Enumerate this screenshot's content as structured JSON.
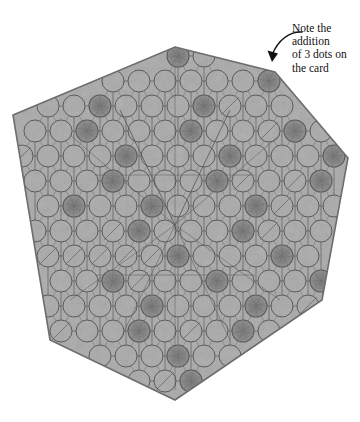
{
  "figure": {
    "kind": "hexagonal-game-board-photo",
    "shape": "hexagon",
    "background_color": "#ffffff",
    "board_fill": "#a9a9a9",
    "board_edge_color": "#6d6d6d",
    "circle_stroke": "#4a4a4a",
    "dark_dot_fill": "#7a7a7a",
    "line_color": "#5a5a5a"
  },
  "annotation": {
    "arrow_color": "#111111",
    "lines": [
      "Note the",
      "addition",
      "of 3 dots on",
      "the card"
    ],
    "full_text": "Note the addition of 3 dots on the card"
  },
  "board": {
    "hexagon_points": "175,47 275,72 348,158 322,300 175,400 50,340 13,115",
    "grid": {
      "type": "triangular-lattice",
      "columns": 13,
      "rows": 14,
      "spacing_x": 26,
      "spacing_y": 25,
      "circle_radius": 11,
      "origin_x": 22,
      "origin_y": 56
    },
    "dark_dots": [
      [
        6,
        0
      ],
      [
        9,
        1
      ],
      [
        12,
        1
      ],
      [
        3,
        2
      ],
      [
        7,
        2
      ],
      [
        11,
        2
      ],
      [
        2,
        3
      ],
      [
        6,
        3
      ],
      [
        10,
        3
      ],
      [
        4,
        4
      ],
      [
        8,
        4
      ],
      [
        12,
        4
      ],
      [
        3,
        5
      ],
      [
        7,
        5
      ],
      [
        11,
        5
      ],
      [
        2,
        6
      ],
      [
        5,
        6
      ],
      [
        9,
        6
      ],
      [
        4,
        7
      ],
      [
        8,
        7
      ],
      [
        6,
        8
      ],
      [
        10,
        8
      ],
      [
        3,
        9
      ],
      [
        7,
        9
      ],
      [
        11,
        9
      ],
      [
        5,
        10
      ],
      [
        9,
        10
      ],
      [
        4,
        11
      ],
      [
        8,
        11
      ],
      [
        6,
        12
      ],
      [
        6,
        13
      ]
    ],
    "web_lines": [
      [
        70,
        135,
        175,
        225
      ],
      [
        175,
        225,
        280,
        135
      ],
      [
        175,
        225,
        70,
        300
      ],
      [
        175,
        225,
        280,
        300
      ],
      [
        120,
        110,
        175,
        225
      ],
      [
        230,
        110,
        175,
        225
      ],
      [
        175,
        225,
        175,
        60
      ],
      [
        175,
        225,
        175,
        390
      ],
      [
        95,
        175,
        255,
        175
      ],
      [
        95,
        275,
        255,
        275
      ],
      [
        120,
        340,
        230,
        110
      ],
      [
        230,
        340,
        120,
        110
      ]
    ]
  }
}
